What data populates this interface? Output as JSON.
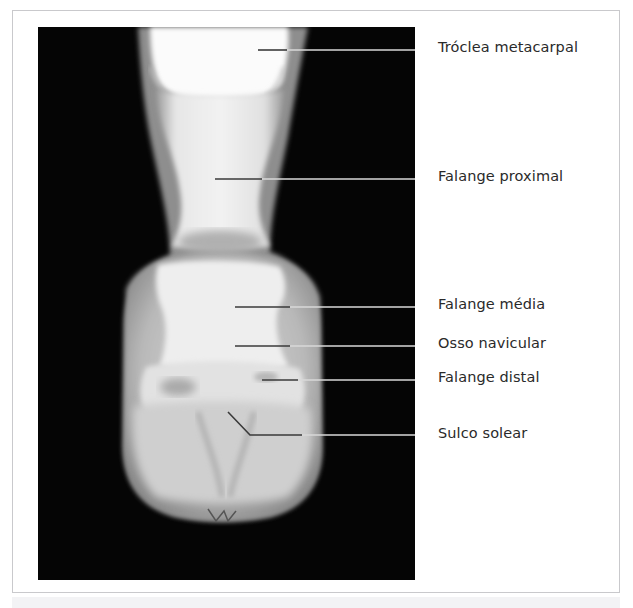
{
  "figure": {
    "type": "radiograph",
    "labels": [
      {
        "id": "troclea",
        "text": "Tróclea metacarpal",
        "y": 50
      },
      {
        "id": "falange-proximal",
        "text": "Falange proximal",
        "y": 179
      },
      {
        "id": "falange-media",
        "text": "Falange média",
        "y": 307
      },
      {
        "id": "osso-navicular",
        "text": "Osso navicular",
        "y": 346
      },
      {
        "id": "falange-distal",
        "text": "Falange distal",
        "y": 380
      },
      {
        "id": "sulco-solear",
        "text": "Sulco solear",
        "y": 435
      }
    ],
    "colors": {
      "background": "#050505",
      "bone_bright": "#f4f4f4",
      "soft_tissue": "#9a9a9a",
      "leader_dark": "#3a3a3a",
      "leader_light": "#d8d8d8",
      "frame_border": "#c9c9cc"
    }
  }
}
